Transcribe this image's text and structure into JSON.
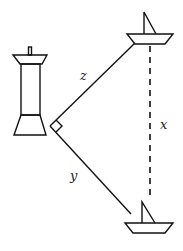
{
  "diagram": {
    "labels": {
      "z": "z",
      "y": "y",
      "x": "x"
    },
    "elements": {
      "lighthouse": "lighthouse",
      "top_boat": "boat",
      "bottom_boat": "boat",
      "right_angle_marker": "right angle"
    },
    "colors": {
      "line": "#111111",
      "background": "#ffffff"
    }
  }
}
